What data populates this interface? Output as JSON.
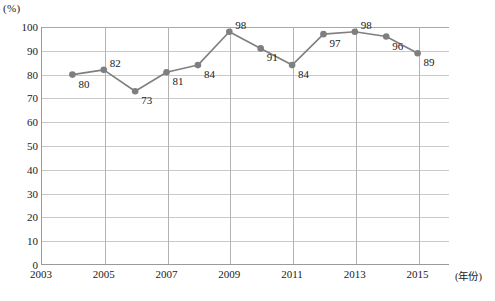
{
  "chart_data": {
    "type": "line",
    "title": "",
    "xlabel": "(年份)",
    "ylabel": "(%)",
    "unit_label": "(%)",
    "x": [
      2004,
      2005,
      2006,
      2007,
      2008,
      2009,
      2010,
      2011,
      2012,
      2013,
      2014,
      2015
    ],
    "values": [
      80,
      82,
      73,
      81,
      84,
      98,
      91,
      84,
      97,
      98,
      96,
      89
    ],
    "point_labels": [
      "80",
      "82",
      "73",
      "81",
      "84",
      "98",
      "91",
      "84",
      "97",
      "98",
      "96",
      "89"
    ],
    "ylim": [
      0,
      100
    ],
    "xlim": [
      2003,
      2016
    ],
    "ytick_labels": [
      "0",
      "10",
      "20",
      "30",
      "40",
      "50",
      "60",
      "70",
      "80",
      "90",
      "100"
    ],
    "ytick_values": [
      0,
      10,
      20,
      30,
      40,
      50,
      60,
      70,
      80,
      90,
      100
    ],
    "xtick_labels": [
      "2003",
      "2005",
      "2007",
      "2009",
      "2011",
      "2013",
      "2015"
    ],
    "xtick_values": [
      2003,
      2005,
      2007,
      2009,
      2011,
      2013,
      2015
    ],
    "grid": "both",
    "legend": "none",
    "series_color": "#7f7f7f",
    "grid_color": "#c9c9c9",
    "axis_color": "#9a9a9a",
    "marker": "circle"
  },
  "caption": {
    "text": ""
  }
}
